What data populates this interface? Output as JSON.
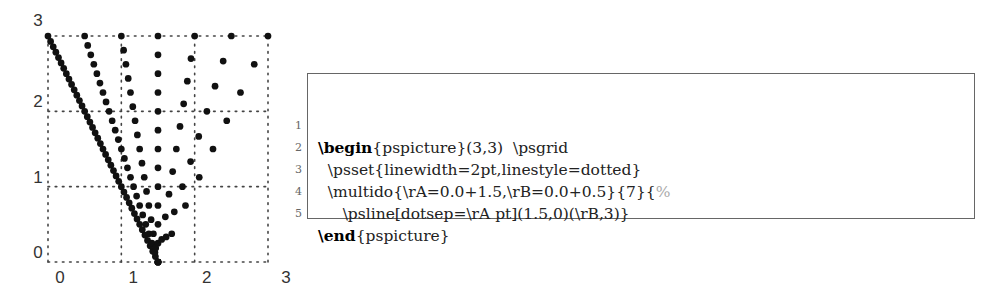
{
  "chart_data": {
    "type": "diagram",
    "title": "",
    "xlim": [
      0,
      3
    ],
    "ylim": [
      0,
      3
    ],
    "grid": true,
    "grid_style": "dotted",
    "x_ticks": [
      "0",
      "1",
      "2",
      "3"
    ],
    "y_ticks": [
      "0",
      "1",
      "2",
      "3"
    ],
    "start_point": [
      1.5,
      0
    ],
    "end_y": 3,
    "lines": [
      {
        "rA": 0.0,
        "rB": 0.0
      },
      {
        "rA": 1.5,
        "rB": 0.5
      },
      {
        "rA": 3.0,
        "rB": 1.0
      },
      {
        "rA": 4.5,
        "rB": 1.5
      },
      {
        "rA": 6.0,
        "rB": 2.0
      },
      {
        "rA": 7.5,
        "rB": 2.5
      },
      {
        "rA": 9.0,
        "rB": 3.0
      }
    ],
    "linewidth": "2pt",
    "linestyle": "dotted"
  },
  "code": {
    "lines": [
      {
        "num": "1",
        "kw": "\\begin",
        "rest": "{pspicture}(3,3)  \\psgrid",
        "indent": "",
        "comment": ""
      },
      {
        "num": "2",
        "kw": "",
        "rest": "\\psset{linewidth=2pt,linestyle=dotted}",
        "indent": "  ",
        "comment": ""
      },
      {
        "num": "3",
        "kw": "",
        "rest": "\\multido{\\rA=0.0+1.5,\\rB=0.0+0.5}{7}{",
        "indent": "  ",
        "comment": "%"
      },
      {
        "num": "4",
        "kw": "",
        "rest": "\\psline[dotsep=\\rA pt](1.5,0)(\\rB,3)}",
        "indent": "     ",
        "comment": ""
      },
      {
        "num": "5",
        "kw": "\\end",
        "rest": "{pspicture}",
        "indent": "",
        "comment": ""
      }
    ]
  }
}
